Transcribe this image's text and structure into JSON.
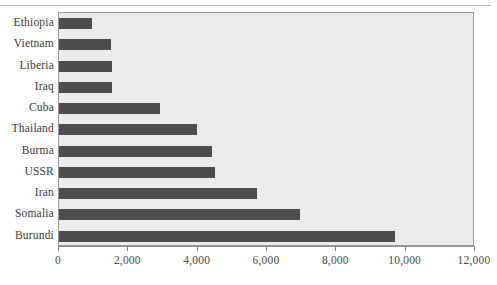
{
  "chart_data": {
    "type": "bar",
    "orientation": "horizontal",
    "title": "",
    "subtitle": "",
    "xlabel": "",
    "ylabel": "",
    "categories": [
      "Ethiopia",
      "Vietnam",
      "Liberia",
      "Iraq",
      "Cuba",
      "Thailand",
      "Burma",
      "USSR",
      "Iran",
      "Somalia",
      "Burundi"
    ],
    "values": [
      950,
      1500,
      1520,
      1540,
      2900,
      3980,
      4400,
      4500,
      5700,
      6950,
      9700
    ],
    "xlim": [
      0,
      12000
    ],
    "xticks": [
      0,
      2000,
      4000,
      6000,
      8000,
      10000,
      12000
    ],
    "xticklabels": [
      "0",
      "2,000",
      "4,000",
      "6,000",
      "8,000",
      "10,000",
      "12,000"
    ],
    "grid": false,
    "legend": null,
    "series": [
      {
        "name": "",
        "values": [
          950,
          1500,
          1520,
          1540,
          2900,
          3980,
          4400,
          4500,
          5700,
          6950,
          9700
        ]
      }
    ]
  },
  "style": {
    "bar_color": "#4d4d4d",
    "plot_background": "#ebebeb",
    "page_background": "#ffffff",
    "axis_color": "#8d8d8d",
    "label_color": "#3b3b3b"
  }
}
